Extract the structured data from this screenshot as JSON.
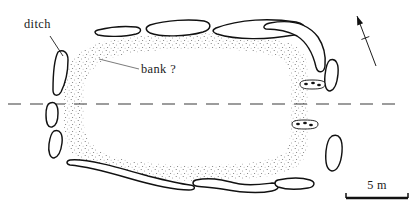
{
  "figure": {
    "kind": "archaeological-site-plan",
    "background_color": "#ffffff",
    "ink_color": "#111111",
    "width": 412,
    "height": 214
  },
  "labels": {
    "ditch": "ditch",
    "bank": "bank ?"
  },
  "scale_bar": {
    "text": "5 m",
    "length_px": 62,
    "x": 346,
    "y": 198
  },
  "north_arrow": {
    "name": "north-arrow",
    "tail": [
      376,
      66
    ],
    "tip": [
      357,
      16
    ]
  },
  "centre_line": {
    "name": "section-centre-line",
    "y": 104,
    "x_start": 8,
    "x_end": 404,
    "dash": "13 9"
  },
  "bank": {
    "name": "bank-enclosure-stipple",
    "description": "stippled sub-rectangular bank band enclosing the interior",
    "outer": "M 64 100 C 62 72 72 52 96 44 C 140 30 250 30 286 42 C 302 47 308 58 308 72 L 308 142 C 308 156 302 166 286 172 C 250 184 140 184 96 170 C 72 162 62 142 64 114 Z",
    "inner": "M 84 100 C 82 80 92 64 110 58 C 150 46 244 46 274 56 C 286 60 290 68 290 80 L 290 134 C 290 146 286 154 274 158 C 244 168 150 168 110 156 C 92 150 82 134 84 114 Z"
  },
  "ditch_segments": [
    {
      "name": "ditch-segment-nw-short",
      "path": "M 98 30 C 110 27 126 26 136 27 C 142 28 142 32 136 34 C 124 37 106 37 98 35 C 94 33 94 31 98 30 Z"
    },
    {
      "name": "ditch-segment-n-left",
      "path": "M 150 25 C 166 20 190 19 204 21 C 212 23 212 29 203 32 C 186 37 160 37 150 33 C 145 30 145 27 150 25 Z"
    },
    {
      "name": "ditch-segment-n-long",
      "path": "M 216 28 C 240 19 270 18 296 22 C 308 25 308 32 294 35 C 266 40 236 40 217 34 C 212 32 212 30 216 28 Z"
    },
    {
      "name": "ditch-segment-ne-curve",
      "path": "M 270 23 C 292 19 308 24 318 37 C 324 46 326 56 325 66 C 324 73 318 74 316 67 C 313 54 308 43 297 36 C 286 30 274 29 266 29 C 262 28 264 24 270 23 Z"
    },
    {
      "name": "ditch-segment-w-upper",
      "path": "M 58 52 C 63 49 68 52 68 60 C 68 72 65 84 61 92 C 58 97 53 96 53 90 C 53 78 54 60 58 52 Z"
    },
    {
      "name": "ditch-segment-w-middle",
      "path": "M 50 103 C 55 101 58 105 58 113 C 58 120 56 126 52 127 C 48 128 46 123 46 115 C 46 109 47 104 50 103 Z"
    },
    {
      "name": "ditch-segment-w-lower",
      "path": "M 54 131 C 60 129 63 134 62 143 C 61 151 58 157 54 158 C 50 158 48 152 49 144 C 50 137 51 133 54 131 Z"
    },
    {
      "name": "ditch-segment-e-upper",
      "path": "M 330 60 C 336 58 339 64 338 74 C 337 84 334 90 330 91 C 326 91 324 85 325 75 C 326 66 327 62 330 60 Z"
    },
    {
      "name": "ditch-segment-e-lower",
      "path": "M 332 136 C 339 133 343 139 342 152 C 341 164 337 171 332 171 C 327 170 325 163 326 151 C 327 142 329 138 332 136 Z"
    },
    {
      "name": "ditch-segment-s-long",
      "path": "M 70 160 C 86 158 120 168 148 176 C 168 181 182 184 190 185 C 196 186 196 190 189 190 C 176 190 152 185 128 178 C 104 171 82 166 70 165 C 66 164 66 161 70 160 Z"
    },
    {
      "name": "ditch-segment-s-middle",
      "path": "M 196 180 C 214 176 228 182 240 184 C 252 186 264 184 272 183 C 280 183 281 189 272 191 C 258 194 238 192 222 189 C 210 187 200 187 196 186 C 192 185 192 181 196 180 Z"
    },
    {
      "name": "ditch-segment-s-right",
      "path": "M 278 180 C 292 177 304 178 310 180 C 316 182 315 187 308 188 C 296 190 284 189 278 187 C 274 185 274 181 278 180 Z"
    }
  ],
  "pit_groups": [
    {
      "name": "pit-group-north-entrance",
      "outline": "M 300 84 C 300 81 304 80 312 80 C 321 80 325 81 325 84 C 325 88 321 89 312 89 C 304 89 300 88 300 84 Z",
      "dots": [
        [
          306,
          84
        ],
        [
          313,
          83
        ],
        [
          319,
          85
        ]
      ]
    },
    {
      "name": "pit-group-south-entrance",
      "outline": "M 292 124 C 292 121 296 120 304 120 C 314 120 318 121 318 124 C 318 128 314 129 304 129 C 296 129 292 128 292 124 Z",
      "dots": [
        [
          298,
          124
        ],
        [
          305,
          123
        ],
        [
          311,
          125
        ]
      ]
    }
  ],
  "leaders": {
    "ditch_leader": {
      "name": "ditch-leader-line",
      "path": "M 50 36 L 63 56"
    },
    "bank_leader": {
      "name": "bank-leader-line",
      "path": "M 99 59 L 139 69"
    }
  },
  "label_positions": {
    "ditch": {
      "x": 24,
      "y": 28
    },
    "bank": {
      "x": 141,
      "y": 73
    }
  }
}
